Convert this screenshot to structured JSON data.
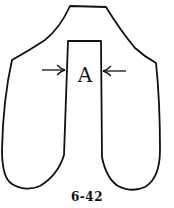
{
  "figure": {
    "label": "A",
    "caption": "6-42",
    "stroke_color": "#111111",
    "background": "#ffffff"
  }
}
